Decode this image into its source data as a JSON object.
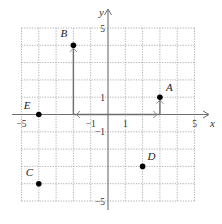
{
  "chart_data": {
    "type": "scatter",
    "title": "",
    "xlabel": "x",
    "ylabel": "y",
    "xlim": [
      -5,
      5
    ],
    "ylim": [
      -5,
      5
    ],
    "grid": true,
    "x_ticks": [
      {
        "value": -5,
        "label": "−5"
      },
      {
        "value": -1,
        "label": "−1"
      },
      {
        "value": 1,
        "label": "1"
      },
      {
        "value": 5,
        "label": "5"
      }
    ],
    "y_ticks": [
      {
        "value": 5,
        "label": "5"
      },
      {
        "value": 1,
        "label": "1"
      },
      {
        "value": -1,
        "label": "−1"
      },
      {
        "value": -5,
        "label": "−5"
      }
    ],
    "points": [
      {
        "name": "A",
        "x": 3,
        "y": 1
      },
      {
        "name": "B",
        "x": -2,
        "y": 4
      },
      {
        "name": "C",
        "x": -4,
        "y": -4
      },
      {
        "name": "D",
        "x": 2,
        "y": -3
      },
      {
        "name": "E",
        "x": -4,
        "y": 0
      }
    ],
    "vectors": [
      {
        "from": [
          0,
          0
        ],
        "to": [
          -2,
          0
        ]
      },
      {
        "from": [
          -2,
          0
        ],
        "to": [
          -2,
          4
        ]
      },
      {
        "from": [
          0,
          0
        ],
        "to": [
          3,
          0
        ]
      },
      {
        "from": [
          3,
          0
        ],
        "to": [
          3,
          1
        ]
      }
    ]
  }
}
